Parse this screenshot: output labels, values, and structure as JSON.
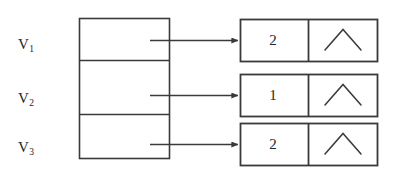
{
  "figure": {
    "type": "adjacency-list-diagram",
    "stroke_color": "#3a3a3a",
    "text_color": "#262626",
    "background_color": "#ffffff"
  },
  "vertex_table": {
    "rows": [
      {
        "label_base": "V",
        "label_sub": "1"
      },
      {
        "label_base": "V",
        "label_sub": "2"
      },
      {
        "label_base": "V",
        "label_sub": "3"
      }
    ]
  },
  "nodes": [
    {
      "value": "2",
      "pointer": "null-caret"
    },
    {
      "value": "1",
      "pointer": "null-caret"
    },
    {
      "value": "2",
      "pointer": "null-caret"
    }
  ],
  "edges": [
    {
      "from": "V1",
      "to": "node-1",
      "style": "arrow"
    },
    {
      "from": "V2",
      "to": "node-2",
      "style": "arrow"
    },
    {
      "from": "V3",
      "to": "node-3",
      "style": "arrow"
    }
  ]
}
